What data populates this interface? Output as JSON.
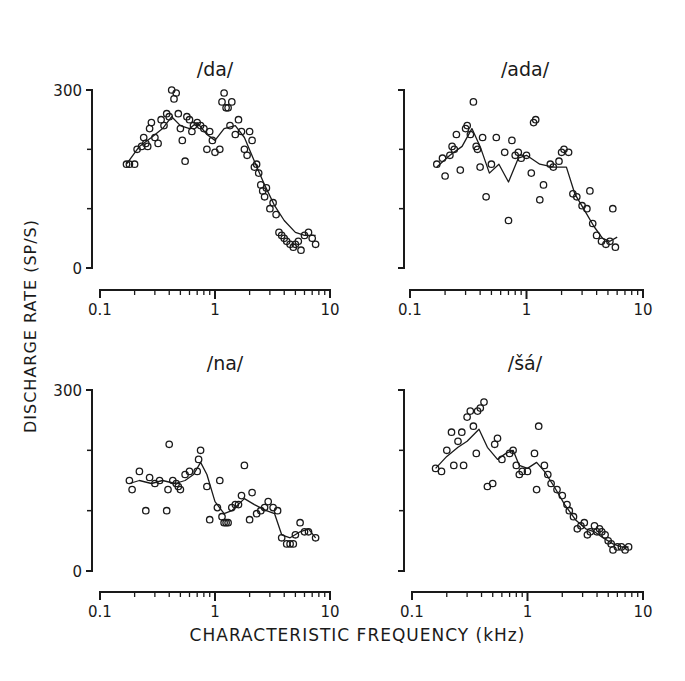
{
  "figure": {
    "ylabel": "DISCHARGE   RATE   (SP/S)",
    "xlabel": "CHARACTERISTIC   FREQUENCY   (kHz)"
  },
  "chart_data": [
    {
      "type": "scatter",
      "title": "/da/",
      "xlabel": "Characteristic Frequency (kHz)",
      "ylabel": "Discharge Rate (sp/s)",
      "xscale": "log",
      "xlim": [
        0.1,
        10
      ],
      "ylim": [
        0,
        300
      ],
      "xticks": [
        "0.1",
        "1",
        "10"
      ],
      "yticks": [
        "0",
        "300"
      ],
      "points": [
        [
          0.17,
          175
        ],
        [
          0.18,
          175
        ],
        [
          0.2,
          175
        ],
        [
          0.21,
          200
        ],
        [
          0.23,
          205
        ],
        [
          0.24,
          220
        ],
        [
          0.25,
          210
        ],
        [
          0.26,
          205
        ],
        [
          0.27,
          235
        ],
        [
          0.28,
          245
        ],
        [
          0.3,
          220
        ],
        [
          0.32,
          210
        ],
        [
          0.34,
          250
        ],
        [
          0.36,
          240
        ],
        [
          0.38,
          260
        ],
        [
          0.4,
          255
        ],
        [
          0.42,
          300
        ],
        [
          0.44,
          285
        ],
        [
          0.46,
          295
        ],
        [
          0.48,
          260
        ],
        [
          0.5,
          235
        ],
        [
          0.52,
          215
        ],
        [
          0.55,
          180
        ],
        [
          0.57,
          255
        ],
        [
          0.6,
          250
        ],
        [
          0.63,
          230
        ],
        [
          0.65,
          240
        ],
        [
          0.7,
          245
        ],
        [
          0.75,
          240
        ],
        [
          0.8,
          235
        ],
        [
          0.85,
          200
        ],
        [
          0.9,
          230
        ],
        [
          0.95,
          215
        ],
        [
          1.0,
          195
        ],
        [
          1.1,
          200
        ],
        [
          1.15,
          280
        ],
        [
          1.2,
          295
        ],
        [
          1.25,
          270
        ],
        [
          1.3,
          270
        ],
        [
          1.35,
          240
        ],
        [
          1.4,
          280
        ],
        [
          1.5,
          225
        ],
        [
          1.6,
          250
        ],
        [
          1.7,
          230
        ],
        [
          1.8,
          200
        ],
        [
          1.9,
          190
        ],
        [
          2.0,
          230
        ],
        [
          2.1,
          215
        ],
        [
          2.2,
          170
        ],
        [
          2.3,
          175
        ],
        [
          2.4,
          160
        ],
        [
          2.5,
          140
        ],
        [
          2.6,
          130
        ],
        [
          2.7,
          120
        ],
        [
          2.8,
          135
        ],
        [
          3.0,
          100
        ],
        [
          3.2,
          110
        ],
        [
          3.4,
          90
        ],
        [
          3.6,
          60
        ],
        [
          3.8,
          55
        ],
        [
          4.0,
          50
        ],
        [
          4.2,
          45
        ],
        [
          4.5,
          40
        ],
        [
          4.8,
          35
        ],
        [
          5.0,
          40
        ],
        [
          5.3,
          45
        ],
        [
          5.6,
          30
        ],
        [
          6.0,
          55
        ],
        [
          6.5,
          60
        ],
        [
          7.0,
          50
        ],
        [
          7.5,
          40
        ]
      ],
      "curve": [
        [
          0.17,
          175
        ],
        [
          0.22,
          205
        ],
        [
          0.28,
          220
        ],
        [
          0.35,
          235
        ],
        [
          0.42,
          255
        ],
        [
          0.5,
          240
        ],
        [
          0.6,
          235
        ],
        [
          0.7,
          245
        ],
        [
          0.85,
          225
        ],
        [
          1.0,
          215
        ],
        [
          1.2,
          235
        ],
        [
          1.5,
          240
        ],
        [
          1.8,
          220
        ],
        [
          2.2,
          180
        ],
        [
          2.7,
          140
        ],
        [
          3.3,
          105
        ],
        [
          4.0,
          80
        ],
        [
          5.0,
          60
        ],
        [
          6.0,
          55
        ],
        [
          7.5,
          55
        ]
      ]
    },
    {
      "type": "scatter",
      "title": "/ada/",
      "xlabel": "Characteristic Frequency (kHz)",
      "ylabel": "Discharge Rate (sp/s)",
      "xscale": "log",
      "xlim": [
        0.1,
        10
      ],
      "ylim": [
        0,
        300
      ],
      "xticks": [
        "0.1",
        "1",
        "10"
      ],
      "yticks": [
        "0",
        "300"
      ],
      "points": [
        [
          0.17,
          175
        ],
        [
          0.19,
          185
        ],
        [
          0.2,
          155
        ],
        [
          0.22,
          190
        ],
        [
          0.23,
          205
        ],
        [
          0.24,
          200
        ],
        [
          0.25,
          225
        ],
        [
          0.27,
          165
        ],
        [
          0.3,
          235
        ],
        [
          0.31,
          240
        ],
        [
          0.33,
          225
        ],
        [
          0.35,
          280
        ],
        [
          0.37,
          205
        ],
        [
          0.38,
          200
        ],
        [
          0.4,
          170
        ],
        [
          0.42,
          220
        ],
        [
          0.45,
          120
        ],
        [
          0.5,
          175
        ],
        [
          0.55,
          220
        ],
        [
          0.65,
          195
        ],
        [
          0.7,
          80
        ],
        [
          0.75,
          215
        ],
        [
          0.8,
          190
        ],
        [
          0.85,
          195
        ],
        [
          0.9,
          185
        ],
        [
          1.0,
          190
        ],
        [
          1.1,
          160
        ],
        [
          1.15,
          245
        ],
        [
          1.2,
          250
        ],
        [
          1.3,
          115
        ],
        [
          1.4,
          140
        ],
        [
          1.6,
          175
        ],
        [
          1.7,
          170
        ],
        [
          1.9,
          180
        ],
        [
          2.0,
          195
        ],
        [
          2.1,
          200
        ],
        [
          2.3,
          195
        ],
        [
          2.5,
          125
        ],
        [
          2.7,
          120
        ],
        [
          3.0,
          105
        ],
        [
          3.3,
          100
        ],
        [
          3.5,
          130
        ],
        [
          3.7,
          75
        ],
        [
          4.0,
          55
        ],
        [
          4.4,
          45
        ],
        [
          4.8,
          40
        ],
        [
          5.2,
          45
        ],
        [
          5.5,
          100
        ],
        [
          5.8,
          35
        ]
      ],
      "curve": [
        [
          0.17,
          170
        ],
        [
          0.22,
          190
        ],
        [
          0.28,
          205
        ],
        [
          0.34,
          235
        ],
        [
          0.4,
          205
        ],
        [
          0.48,
          160
        ],
        [
          0.58,
          175
        ],
        [
          0.7,
          145
        ],
        [
          0.85,
          185
        ],
        [
          1.0,
          190
        ],
        [
          1.3,
          175
        ],
        [
          1.7,
          170
        ],
        [
          2.2,
          170
        ],
        [
          2.6,
          125
        ],
        [
          3.2,
          95
        ],
        [
          3.8,
          70
        ],
        [
          4.5,
          50
        ],
        [
          5.2,
          45
        ],
        [
          6.0,
          52
        ]
      ]
    },
    {
      "type": "scatter",
      "title": "/na/",
      "xlabel": "Characteristic Frequency (kHz)",
      "ylabel": "Discharge Rate (sp/s)",
      "xscale": "log",
      "xlim": [
        0.1,
        10
      ],
      "ylim": [
        0,
        300
      ],
      "xticks": [
        "0.1",
        "1",
        "10"
      ],
      "yticks": [
        "0",
        "300"
      ],
      "points": [
        [
          0.18,
          150
        ],
        [
          0.19,
          135
        ],
        [
          0.22,
          165
        ],
        [
          0.25,
          100
        ],
        [
          0.27,
          155
        ],
        [
          0.3,
          145
        ],
        [
          0.33,
          150
        ],
        [
          0.38,
          100
        ],
        [
          0.39,
          135
        ],
        [
          0.4,
          210
        ],
        [
          0.43,
          150
        ],
        [
          0.46,
          145
        ],
        [
          0.48,
          140
        ],
        [
          0.5,
          135
        ],
        [
          0.55,
          160
        ],
        [
          0.6,
          165
        ],
        [
          0.7,
          165
        ],
        [
          0.72,
          185
        ],
        [
          0.75,
          200
        ],
        [
          0.85,
          140
        ],
        [
          0.9,
          85
        ],
        [
          1.05,
          105
        ],
        [
          1.1,
          150
        ],
        [
          1.15,
          90
        ],
        [
          1.2,
          80
        ],
        [
          1.25,
          80
        ],
        [
          1.3,
          80
        ],
        [
          1.4,
          105
        ],
        [
          1.5,
          110
        ],
        [
          1.6,
          110
        ],
        [
          1.7,
          125
        ],
        [
          1.8,
          175
        ],
        [
          2.0,
          85
        ],
        [
          2.1,
          130
        ],
        [
          2.3,
          95
        ],
        [
          2.5,
          100
        ],
        [
          2.7,
          105
        ],
        [
          2.9,
          115
        ],
        [
          3.2,
          105
        ],
        [
          3.5,
          100
        ],
        [
          3.8,
          55
        ],
        [
          4.2,
          45
        ],
        [
          4.5,
          45
        ],
        [
          4.8,
          45
        ],
        [
          5.0,
          60
        ],
        [
          5.5,
          80
        ],
        [
          6.0,
          65
        ],
        [
          6.5,
          65
        ],
        [
          7.5,
          55
        ]
      ],
      "curve": [
        [
          0.18,
          145
        ],
        [
          0.22,
          150
        ],
        [
          0.28,
          145
        ],
        [
          0.35,
          150
        ],
        [
          0.45,
          145
        ],
        [
          0.55,
          150
        ],
        [
          0.65,
          160
        ],
        [
          0.75,
          180
        ],
        [
          0.85,
          160
        ],
        [
          1.0,
          115
        ],
        [
          1.2,
          95
        ],
        [
          1.4,
          100
        ],
        [
          1.8,
          120
        ],
        [
          2.2,
          110
        ],
        [
          2.8,
          100
        ],
        [
          3.3,
          95
        ],
        [
          3.8,
          60
        ],
        [
          4.5,
          55
        ],
        [
          5.5,
          65
        ],
        [
          6.5,
          70
        ],
        [
          7.5,
          55
        ]
      ]
    },
    {
      "type": "scatter",
      "title": "/šá/",
      "xlabel": "Characteristic Frequency (kHz)",
      "ylabel": "Discharge Rate (sp/s)",
      "xscale": "log",
      "xlim": [
        0.1,
        10
      ],
      "ylim": [
        0,
        300
      ],
      "xticks": [
        "0.1",
        "1",
        "10"
      ],
      "yticks": [
        "0",
        "300"
      ],
      "points": [
        [
          0.16,
          170
        ],
        [
          0.18,
          165
        ],
        [
          0.2,
          200
        ],
        [
          0.22,
          230
        ],
        [
          0.23,
          175
        ],
        [
          0.25,
          215
        ],
        [
          0.27,
          230
        ],
        [
          0.28,
          175
        ],
        [
          0.3,
          255
        ],
        [
          0.32,
          265
        ],
        [
          0.34,
          240
        ],
        [
          0.36,
          195
        ],
        [
          0.37,
          265
        ],
        [
          0.39,
          270
        ],
        [
          0.42,
          280
        ],
        [
          0.45,
          140
        ],
        [
          0.5,
          145
        ],
        [
          0.52,
          210
        ],
        [
          0.55,
          220
        ],
        [
          0.6,
          185
        ],
        [
          0.7,
          195
        ],
        [
          0.75,
          200
        ],
        [
          0.8,
          175
        ],
        [
          0.85,
          160
        ],
        [
          0.9,
          165
        ],
        [
          1.0,
          165
        ],
        [
          1.15,
          195
        ],
        [
          1.2,
          135
        ],
        [
          1.25,
          240
        ],
        [
          1.4,
          175
        ],
        [
          1.5,
          160
        ],
        [
          1.6,
          145
        ],
        [
          1.8,
          135
        ],
        [
          2.0,
          125
        ],
        [
          2.2,
          110
        ],
        [
          2.3,
          100
        ],
        [
          2.5,
          90
        ],
        [
          2.7,
          70
        ],
        [
          2.9,
          75
        ],
        [
          3.1,
          80
        ],
        [
          3.3,
          60
        ],
        [
          3.5,
          65
        ],
        [
          3.8,
          75
        ],
        [
          4.0,
          65
        ],
        [
          4.2,
          70
        ],
        [
          4.4,
          65
        ],
        [
          4.7,
          60
        ],
        [
          5.0,
          50
        ],
        [
          5.3,
          45
        ],
        [
          5.5,
          35
        ],
        [
          6.0,
          40
        ],
        [
          6.5,
          40
        ],
        [
          7.0,
          35
        ],
        [
          7.5,
          40
        ]
      ],
      "curve": [
        [
          0.16,
          170
        ],
        [
          0.2,
          190
        ],
        [
          0.25,
          205
        ],
        [
          0.3,
          215
        ],
        [
          0.38,
          235
        ],
        [
          0.45,
          205
        ],
        [
          0.55,
          185
        ],
        [
          0.65,
          195
        ],
        [
          0.75,
          200
        ],
        [
          0.85,
          175
        ],
        [
          1.0,
          170
        ],
        [
          1.2,
          180
        ],
        [
          1.4,
          165
        ],
        [
          1.7,
          140
        ],
        [
          2.1,
          110
        ],
        [
          2.6,
          85
        ],
        [
          3.2,
          70
        ],
        [
          3.8,
          65
        ],
        [
          4.5,
          55
        ],
        [
          5.5,
          45
        ],
        [
          6.5,
          40
        ],
        [
          7.5,
          40
        ]
      ]
    }
  ]
}
